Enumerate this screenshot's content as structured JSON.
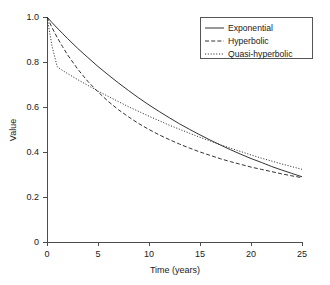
{
  "chart_data": {
    "type": "line",
    "title": "",
    "xlabel": "Time (years)",
    "ylabel": "Value",
    "xlim": [
      0,
      25
    ],
    "ylim": [
      0,
      1.0
    ],
    "grid": false,
    "legend_position": "top-right",
    "xticks": [
      "0",
      "5",
      "10",
      "15",
      "20",
      "25"
    ],
    "xtick_values": [
      0,
      5,
      10,
      15,
      20,
      25
    ],
    "yticks": [
      "0",
      "0.2",
      "0.4",
      "0.6",
      "0.8",
      "1.0"
    ],
    "ytick_values": [
      0,
      0.2,
      0.4,
      0.6,
      0.8,
      1.0
    ],
    "x": [
      0,
      0.5,
      1,
      1.5,
      2,
      3,
      4,
      5,
      6,
      7,
      8,
      9,
      10,
      11,
      12,
      13,
      14,
      15,
      16,
      17,
      18,
      19,
      20,
      21,
      22,
      23,
      24,
      25
    ],
    "series": [
      {
        "name": "Exponential",
        "style": "solid",
        "color": "#333333",
        "values": [
          1.0,
          0.975,
          0.951,
          0.928,
          0.905,
          0.861,
          0.82,
          0.78,
          0.743,
          0.707,
          0.673,
          0.64,
          0.609,
          0.58,
          0.552,
          0.525,
          0.5,
          0.476,
          0.453,
          0.431,
          0.41,
          0.39,
          0.371,
          0.354,
          0.336,
          0.32,
          0.305,
          0.29
        ]
      },
      {
        "name": "Hyperbolic",
        "style": "dashed",
        "color": "#333333",
        "values": [
          1.0,
          0.952,
          0.909,
          0.87,
          0.833,
          0.769,
          0.714,
          0.667,
          0.625,
          0.588,
          0.556,
          0.526,
          0.5,
          0.476,
          0.455,
          0.435,
          0.417,
          0.4,
          0.385,
          0.37,
          0.357,
          0.345,
          0.333,
          0.323,
          0.313,
          0.303,
          0.294,
          0.286
        ]
      },
      {
        "name": "Quasi-hyperbolic",
        "style": "dotted",
        "color": "#333333",
        "values": [
          1.0,
          0.869,
          0.779,
          0.763,
          0.749,
          0.722,
          0.696,
          0.671,
          0.647,
          0.624,
          0.601,
          0.58,
          0.559,
          0.539,
          0.519,
          0.501,
          0.483,
          0.465,
          0.449,
          0.432,
          0.417,
          0.402,
          0.387,
          0.373,
          0.36,
          0.347,
          0.335,
          0.323
        ]
      }
    ]
  },
  "legend": {
    "items": [
      {
        "label": "Exponential"
      },
      {
        "label": "Hyperbolic"
      },
      {
        "label": "Quasi-hyperbolic"
      }
    ]
  }
}
